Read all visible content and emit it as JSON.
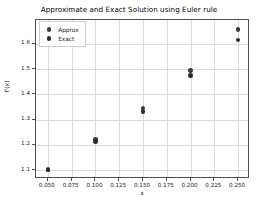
{
  "chart_data": {
    "type": "scatter",
    "title": "Approximate and Exact Solution using Euler rule",
    "xlabel": "x",
    "ylabel": "f'(x)",
    "xlim": [
      0.0375,
      0.2625
    ],
    "ylim": [
      1.065,
      1.695
    ],
    "grid": true,
    "legend_position": "upper left",
    "xticks": [
      0.05,
      0.075,
      0.1,
      0.125,
      0.15,
      0.175,
      0.2,
      0.225,
      0.25
    ],
    "xtick_labels": [
      "0.050",
      "0.075",
      "0.100",
      "0.125",
      "0.150",
      "0.175",
      "0.200",
      "0.225",
      "0.250"
    ],
    "yticks": [
      1.1,
      1.2,
      1.3,
      1.4,
      1.5,
      1.6
    ],
    "ytick_labels": [
      "1.1",
      "1.2",
      "1.3",
      "1.4",
      "1.5",
      "1.6"
    ],
    "x": [
      0.05,
      0.1,
      0.15,
      0.2,
      0.25
    ],
    "series": [
      {
        "name": "Approx",
        "marker": "circle",
        "color": "#3b3b3b",
        "values": [
          1.102,
          1.221,
          1.347,
          1.496,
          1.657
        ]
      },
      {
        "name": "Exact",
        "marker": "circle",
        "color": "#2a2a2a",
        "values": [
          1.1,
          1.213,
          1.333,
          1.474,
          1.616
        ]
      }
    ]
  },
  "legend": {
    "entries": [
      {
        "label": "Approx"
      },
      {
        "label": "Exact"
      }
    ]
  },
  "colors": {
    "approx": "#3b3b3b",
    "exact": "#2a2a2a",
    "grid": "#d9d9d9",
    "axis": "#4d4d4d",
    "background": "#ffffff"
  }
}
